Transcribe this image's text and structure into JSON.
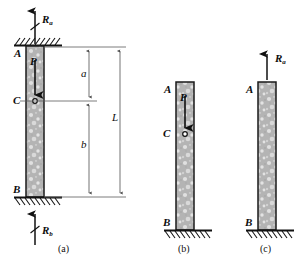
{
  "figure": {
    "type": "engineering-diagram"
  },
  "panels": [
    {
      "id": "a",
      "caption": "(a)",
      "reactions": [
        {
          "name": "reaction-top",
          "label": "R",
          "subscript": "a",
          "direction": "up"
        },
        {
          "name": "reaction-bottom",
          "label": "R",
          "subscript": "b",
          "direction": "up"
        }
      ],
      "points": [
        {
          "id": "A",
          "label": "A",
          "position": "top"
        },
        {
          "id": "C",
          "label": "C",
          "position": "middle"
        },
        {
          "id": "B",
          "label": "B",
          "position": "bottom"
        }
      ],
      "load": {
        "label": "P",
        "direction": "down"
      },
      "dimensions": [
        {
          "label": "a",
          "span": "A-to-C"
        },
        {
          "label": "b",
          "span": "C-to-B"
        },
        {
          "label": "L",
          "span": "A-to-B"
        }
      ],
      "supports": [
        "fixed-top",
        "fixed-bottom"
      ]
    },
    {
      "id": "b",
      "caption": "(b)",
      "points": [
        {
          "id": "A",
          "label": "A",
          "position": "top"
        },
        {
          "id": "C",
          "label": "C",
          "position": "middle"
        },
        {
          "id": "B",
          "label": "B",
          "position": "bottom"
        }
      ],
      "load": {
        "label": "P",
        "direction": "down"
      },
      "supports": [
        "fixed-bottom"
      ]
    },
    {
      "id": "c",
      "caption": "(c)",
      "reactions": [
        {
          "name": "reaction-top",
          "label": "R",
          "subscript": "a",
          "direction": "up"
        }
      ],
      "points": [
        {
          "id": "A",
          "label": "A",
          "position": "top"
        },
        {
          "id": "B",
          "label": "B",
          "position": "bottom"
        }
      ],
      "supports": [
        "fixed-bottom"
      ]
    }
  ],
  "colors": {
    "bar_fill": "#b8b8b8",
    "bar_stroke": "#1a1a1a",
    "line": "#4a4a4a",
    "text": "#111111",
    "hatch": "#1a1a1a"
  }
}
